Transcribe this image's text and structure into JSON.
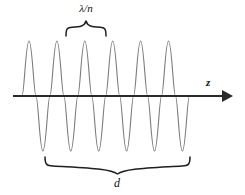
{
  "figure": {
    "name": "standing-wave-in-cavity-diagram",
    "background_color": "#ffffff",
    "labels": {
      "wavelength_label": "λ/n",
      "distance_label": "d",
      "axis_label": "z"
    },
    "colors": {
      "wave_stroke": "#7c7c7c",
      "axis_stroke": "#2a2a2a",
      "brace_stroke": "#1f1f1f",
      "text": "#111111"
    },
    "axis": {
      "orientation": "horizontal",
      "y": 96,
      "x_start": 13,
      "x_end": 232,
      "has_arrowhead": true,
      "arrow_direction": "right"
    },
    "wave": {
      "type": "sinusoid",
      "cycles": 5,
      "period_px": 34.6,
      "amplitude_px": 55,
      "baseline_y": 96,
      "x_start": 22,
      "x_end": 195,
      "peak_y": 41,
      "trough_y": 151,
      "peaks_x": [
        29,
        64,
        99,
        133,
        168
      ],
      "troughs_x": [
        47,
        81,
        116,
        151,
        185
      ]
    },
    "braces": {
      "top": {
        "label": "λ/n",
        "x_left": 66,
        "x_right": 106,
        "y_base": 36,
        "y_tip": 21,
        "direction": "up",
        "spans": "one-wavelength"
      },
      "bottom": {
        "label": "d",
        "x_left": 45,
        "x_right": 190,
        "y_base": 157,
        "y_tip": 174,
        "direction": "down",
        "spans": "cavity-length"
      }
    }
  }
}
